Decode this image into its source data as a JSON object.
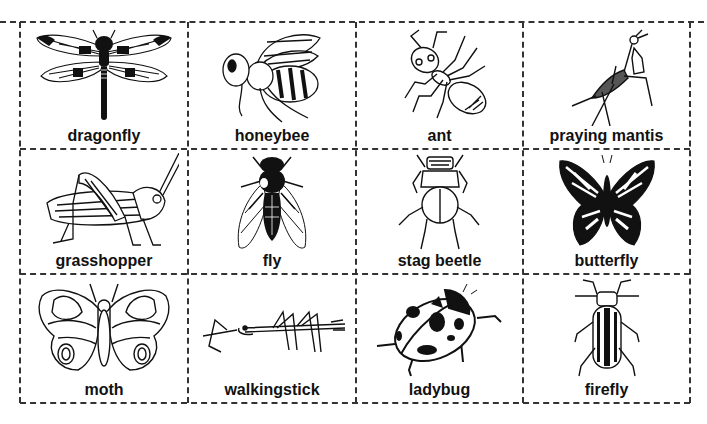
{
  "sheet": {
    "title": "",
    "line_color": "#333333",
    "ink_color": "#111111"
  },
  "cards": [
    {
      "label": "dragonfly",
      "icon": "dragonfly-icon"
    },
    {
      "label": "honeybee",
      "icon": "honeybee-icon"
    },
    {
      "label": "ant",
      "icon": "ant-icon"
    },
    {
      "label": "praying mantis",
      "icon": "praying-mantis-icon"
    },
    {
      "label": "grasshopper",
      "icon": "grasshopper-icon"
    },
    {
      "label": "fly",
      "icon": "fly-icon"
    },
    {
      "label": "stag beetle",
      "icon": "stag-beetle-icon"
    },
    {
      "label": "butterfly",
      "icon": "butterfly-icon"
    },
    {
      "label": "moth",
      "icon": "moth-icon"
    },
    {
      "label": "walkingstick",
      "icon": "walkingstick-icon"
    },
    {
      "label": "ladybug",
      "icon": "ladybug-icon"
    },
    {
      "label": "firefly",
      "icon": "firefly-icon"
    }
  ]
}
